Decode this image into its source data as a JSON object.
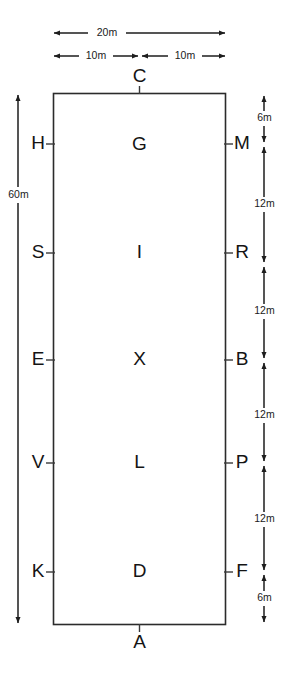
{
  "diagram": {
    "shape": "rectangle",
    "stroke_color": "#2b2b2b",
    "text_color": "#141414",
    "background_color": "#ffffff",
    "top_dimensions": [
      {
        "id": "total-width",
        "label": "20m",
        "from": "left-edge",
        "to": "right-edge"
      },
      {
        "id": "half-width-left",
        "label": "10m",
        "from": "left-edge",
        "to": "centre"
      },
      {
        "id": "half-width-right",
        "label": "10m",
        "from": "centre",
        "to": "right-edge"
      }
    ],
    "left_dimension": {
      "id": "total-height",
      "label": "60m",
      "from": "top-edge",
      "to": "bottom-edge"
    },
    "right_dimensions": [
      {
        "id": "seg-1",
        "label": "6m",
        "from": "C-level",
        "to": "M"
      },
      {
        "id": "seg-2",
        "label": "12m",
        "from": "M",
        "to": "R"
      },
      {
        "id": "seg-3",
        "label": "12m",
        "from": "R",
        "to": "B"
      },
      {
        "id": "seg-4",
        "label": "12m",
        "from": "B",
        "to": "P"
      },
      {
        "id": "seg-5",
        "label": "12m",
        "from": "P",
        "to": "F"
      },
      {
        "id": "seg-6",
        "label": "6m",
        "from": "F",
        "to": "A-level"
      }
    ],
    "edge_points": {
      "top": {
        "label": "C"
      },
      "bottom": {
        "label": "A"
      },
      "left": [
        {
          "label": "H"
        },
        {
          "label": "S"
        },
        {
          "label": "E"
        },
        {
          "label": "V"
        },
        {
          "label": "K"
        }
      ],
      "right": [
        {
          "label": "M"
        },
        {
          "label": "R"
        },
        {
          "label": "B"
        },
        {
          "label": "P"
        },
        {
          "label": "F"
        }
      ]
    },
    "interior_points": [
      {
        "label": "G"
      },
      {
        "label": "I"
      },
      {
        "label": "X"
      },
      {
        "label": "L"
      },
      {
        "label": "D"
      }
    ]
  }
}
